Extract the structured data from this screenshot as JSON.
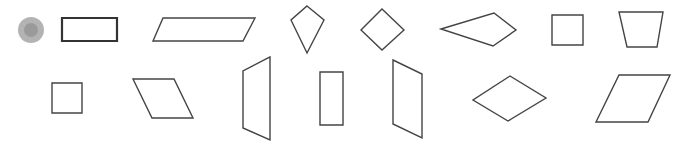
{
  "canvas": {
    "width": 685,
    "height": 145,
    "background": "#ffffff"
  },
  "colors": {
    "stroke": "#444444",
    "stroke_bold": "#333333",
    "marker_outer": "#b3b3b3",
    "marker_inner": "#9a9a9a"
  },
  "marker": {
    "cx": 31,
    "cy": 30,
    "r_outer": 13,
    "r_inner": 7
  },
  "shapes": [
    {
      "name": "rectangle-bold",
      "points": "62,18 117,18 117,41 62,41",
      "stroke_width": 2.2,
      "bold": true
    },
    {
      "name": "parallelogram-wide",
      "points": "163,18 255,18 243,41 153,41",
      "stroke_width": 1.4
    },
    {
      "name": "kite-vertical",
      "points": "307,6 324,20 307,53 291,20",
      "stroke_width": 1.4
    },
    {
      "name": "diamond-square",
      "points": "382,9 404,30 382,50 361,30",
      "stroke_width": 1.4
    },
    {
      "name": "kite-horizontal",
      "points": "441,29 494,13 516,30 493,46",
      "stroke_width": 1.4
    },
    {
      "name": "square-top",
      "points": "552,15 583,15 583,45 552,45",
      "stroke_width": 1.4
    },
    {
      "name": "trapezoid-inverted",
      "points": "619,12 663,12 657,47 627,47",
      "stroke_width": 1.4
    },
    {
      "name": "square-bottom",
      "points": "52,83 82,83 82,113 52,113",
      "stroke_width": 1.4
    },
    {
      "name": "parallelogram-slanted",
      "points": "133,79 174,79 193,118 152,118",
      "stroke_width": 1.4
    },
    {
      "name": "trapezoid-vertical",
      "points": "270,57 270,140 243,128 243,71",
      "stroke_width": 1.4
    },
    {
      "name": "rectangle-vertical",
      "points": "320,72 343,72 343,125 320,125",
      "stroke_width": 1.4
    },
    {
      "name": "parallelogram-vertical",
      "points": "393,60 422,74 422,138 393,124",
      "stroke_width": 1.4
    },
    {
      "name": "rhombus",
      "points": "510,76 546,98 508,121 473,100",
      "stroke_width": 1.4
    },
    {
      "name": "parallelogram-right",
      "points": "619,75 670,75 648,122 596,122",
      "stroke_width": 1.4
    }
  ]
}
